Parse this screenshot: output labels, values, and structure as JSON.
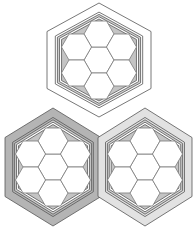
{
  "diagram": {
    "colors": {
      "background": "#ffffff",
      "line": "#555555",
      "cell_fill": "#ffffff",
      "cell_stroke": "#7a7a7a",
      "corner_fill": "#c4c4c4",
      "band_dark": "#b4b4b4",
      "band_light": "#e2e2e2",
      "band_none": "#ffffff"
    },
    "modules": [
      {
        "id": "top",
        "cx": 99,
        "cy": 60,
        "R": 57,
        "hw": 52,
        "band": "band_none",
        "cells": 7
      },
      {
        "id": "bottom-left",
        "cx": 53,
        "cy": 167,
        "R": 59,
        "hw": 48,
        "band": "band_dark",
        "cells": 7
      },
      {
        "id": "bottom-right",
        "cx": 145,
        "cy": 167,
        "R": 59,
        "hw": 47,
        "band": "band_light",
        "cells": 7
      }
    ],
    "cell_radius": 15
  }
}
